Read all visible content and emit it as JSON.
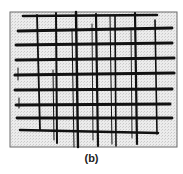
{
  "figure": {
    "caption": "(b)",
    "frame": {
      "x": 10,
      "y": 12,
      "width": 167,
      "height": 135,
      "stroke": "#6a6a6a",
      "fill": "#e6e6e6"
    },
    "line_color": "#111111",
    "horizontal_lines": [
      {
        "x1": 23,
        "y1": 16,
        "x2": 157,
        "y2": 15,
        "w": 2.6
      },
      {
        "x1": 18,
        "y1": 31,
        "x2": 172,
        "y2": 28,
        "w": 2.8
      },
      {
        "x1": 16,
        "y1": 45,
        "x2": 172,
        "y2": 43,
        "w": 3.0
      },
      {
        "x1": 16,
        "y1": 60,
        "x2": 174,
        "y2": 58,
        "w": 3.0
      },
      {
        "x1": 15,
        "y1": 75,
        "x2": 174,
        "y2": 73,
        "w": 3.2
      },
      {
        "x1": 15,
        "y1": 90,
        "x2": 172,
        "y2": 89,
        "w": 3.0
      },
      {
        "x1": 16,
        "y1": 105,
        "x2": 170,
        "y2": 104,
        "w": 3.0
      },
      {
        "x1": 17,
        "y1": 118,
        "x2": 172,
        "y2": 118,
        "w": 2.8
      },
      {
        "x1": 20,
        "y1": 130,
        "x2": 158,
        "y2": 133,
        "w": 2.4
      }
    ],
    "vertical_lines": [
      {
        "x1": 37,
        "y1": 15,
        "x2": 40,
        "y2": 130,
        "w": 1.8
      },
      {
        "x1": 56,
        "y1": 13,
        "x2": 57,
        "y2": 143,
        "w": 2.0
      },
      {
        "x1": 53,
        "y1": 70,
        "x2": 54,
        "y2": 140,
        "w": 1.0
      },
      {
        "x1": 76,
        "y1": 12,
        "x2": 78,
        "y2": 147,
        "w": 2.4
      },
      {
        "x1": 72,
        "y1": 30,
        "x2": 74,
        "y2": 147,
        "w": 1.0
      },
      {
        "x1": 96,
        "y1": 14,
        "x2": 98,
        "y2": 146,
        "w": 2.2
      },
      {
        "x1": 92,
        "y1": 24,
        "x2": 93,
        "y2": 140,
        "w": 0.9
      },
      {
        "x1": 110,
        "y1": 16,
        "x2": 112,
        "y2": 144,
        "w": 1.0
      },
      {
        "x1": 115,
        "y1": 16,
        "x2": 116,
        "y2": 146,
        "w": 1.6
      },
      {
        "x1": 135,
        "y1": 13,
        "x2": 137,
        "y2": 144,
        "w": 2.2
      },
      {
        "x1": 131,
        "y1": 28,
        "x2": 132,
        "y2": 138,
        "w": 0.9
      },
      {
        "x1": 155,
        "y1": 20,
        "x2": 157,
        "y2": 134,
        "w": 1.6
      },
      {
        "x1": 18,
        "y1": 68,
        "x2": 18,
        "y2": 80,
        "w": 1.0
      },
      {
        "x1": 19,
        "y1": 98,
        "x2": 19,
        "y2": 108,
        "w": 1.0
      }
    ]
  }
}
